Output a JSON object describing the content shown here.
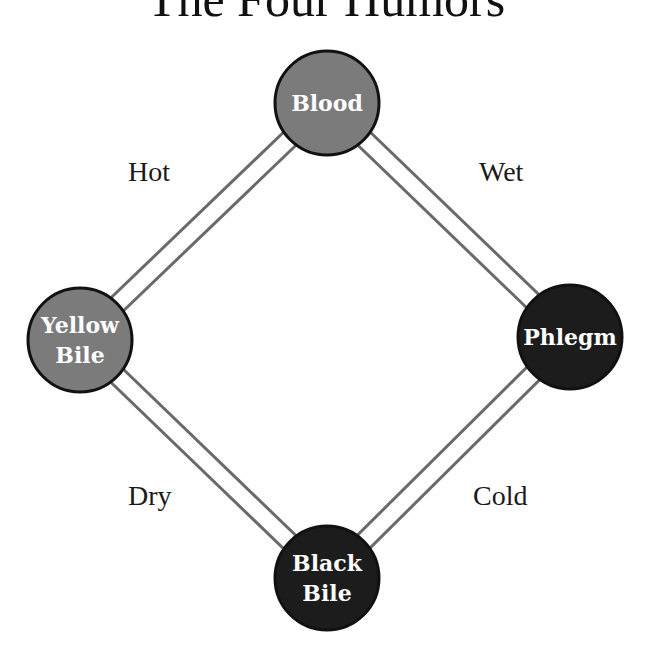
{
  "title": "The Four Humors",
  "colors": {
    "hot_humor_fill": "#7b7b7b",
    "cold_humor_fill": "#1c1c1c",
    "outline": "#111111",
    "connector": "#6a6a6a"
  },
  "humors": [
    {
      "id": "blood",
      "lines": [
        "Blood"
      ],
      "tone": "light"
    },
    {
      "id": "yellow-bile",
      "lines": [
        "Yellow",
        "Bile"
      ],
      "tone": "light"
    },
    {
      "id": "phlegm",
      "lines": [
        "Phlegm"
      ],
      "tone": "dark"
    },
    {
      "id": "black-bile",
      "lines": [
        "Black",
        "Bile"
      ],
      "tone": "dark"
    }
  ],
  "qualities": {
    "hot": "Hot",
    "wet": "Wet",
    "dry": "Dry",
    "cold": "Cold"
  },
  "connections": [
    {
      "from": "blood",
      "to": "yellow-bile",
      "quality": "Hot"
    },
    {
      "from": "blood",
      "to": "phlegm",
      "quality": "Wet"
    },
    {
      "from": "yellow-bile",
      "to": "black-bile",
      "quality": "Dry"
    },
    {
      "from": "phlegm",
      "to": "black-bile",
      "quality": "Cold"
    }
  ]
}
